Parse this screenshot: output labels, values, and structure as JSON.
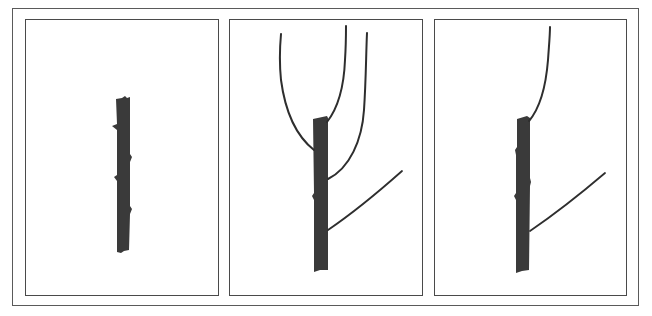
{
  "figure": {
    "colors": {
      "frame": "#5a5a5a",
      "panel_border": "#4a4a4a",
      "stem_fill": "#3a3a3a",
      "branch_stroke": "#2e2e2e",
      "background": "#ffffff"
    },
    "panels": [
      {
        "id": "panel-1",
        "label": "",
        "content": "single unbranched stem with small buds"
      },
      {
        "id": "panel-2",
        "label": "",
        "content": "headed stem with four branches: two upright leaders at top, one curving upright branch mid-stem, one angled lateral branch lower"
      },
      {
        "id": "panel-3",
        "label": "",
        "content": "pruned stem retaining one upright leader and one angled lateral branch"
      }
    ]
  }
}
